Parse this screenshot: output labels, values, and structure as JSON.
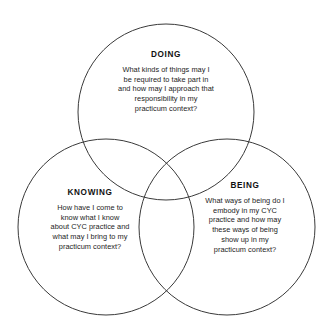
{
  "diagram": {
    "type": "venn-3-circle",
    "background_color": "#ffffff",
    "stroke_color": "#3a3a3a",
    "text_color": "#1c1c1c",
    "circles": [
      {
        "id": "doing",
        "title": "DOING",
        "cx": 166,
        "cy": 112,
        "r": 88,
        "body_lines": [
          "What kinds of things may I",
          "be required to take part in",
          "and how may I approach that",
          "responsibility in my",
          "practicum context?"
        ]
      },
      {
        "id": "knowing",
        "title": "KNOWING",
        "cx": 106,
        "cy": 227,
        "r": 88,
        "body_lines": [
          "How have I come to",
          "know what I know",
          "about CYC practice and",
          "what may I bring to my",
          "practicum context?"
        ]
      },
      {
        "id": "being",
        "title": "BEING",
        "cx": 227,
        "cy": 227,
        "r": 88,
        "body_lines": [
          "What ways of being do I",
          "embody in my CYC",
          "practice and how may",
          "these ways of being",
          "show up in my",
          "practicum context?"
        ]
      }
    ]
  }
}
